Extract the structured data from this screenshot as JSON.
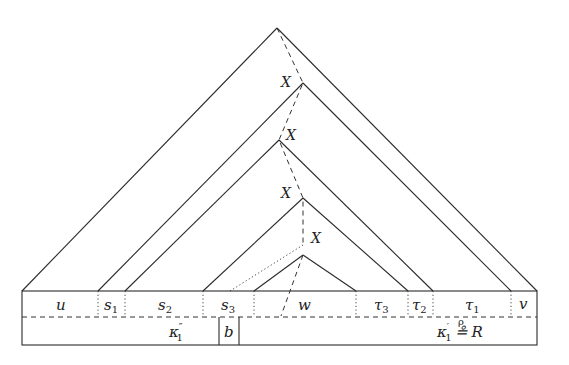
{
  "diagram": {
    "type": "parse-tree",
    "nodes": [
      {
        "label": "X"
      },
      {
        "label": "X"
      },
      {
        "label": "X"
      },
      {
        "label": "X"
      }
    ],
    "segments": [
      {
        "base": "u",
        "sub": ""
      },
      {
        "base": "s",
        "sub": "1"
      },
      {
        "base": "s",
        "sub": "2"
      },
      {
        "base": "s",
        "sub": "3"
      },
      {
        "base": "w",
        "sub": ""
      },
      {
        "base": "τ",
        "sub": "3"
      },
      {
        "base": "τ",
        "sub": "2"
      },
      {
        "base": "τ",
        "sub": "1"
      },
      {
        "base": "v",
        "sub": ""
      }
    ],
    "bottom_row": {
      "left": {
        "base": "κ",
        "sub": "1",
        "prime": "″"
      },
      "middle": "b",
      "right": {
        "base": "κ",
        "sub": "1",
        "prime": "′",
        "relation": "≗",
        "relation_over": "ρ",
        "rhs": "R"
      }
    }
  }
}
